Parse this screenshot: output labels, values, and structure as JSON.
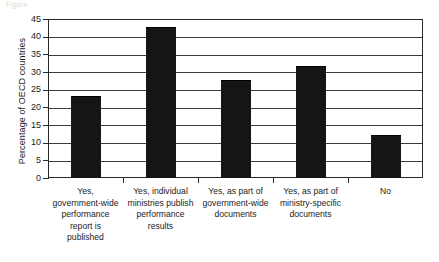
{
  "caption": {
    "text": "Figure"
  },
  "chart_data": {
    "type": "bar",
    "title": "",
    "xlabel": "",
    "ylabel": "Percentage of OECD countries",
    "categories": [
      "Yes, government-wide performance report is published",
      "Yes, individual ministries publish performance results",
      "Yes, as part of government-wide documents",
      "Yes, as part of ministry-specific documents",
      "No"
    ],
    "category_lines": [
      [
        "Yes,",
        "government-wide",
        "performance",
        "report is",
        "published"
      ],
      [
        "Yes, individual",
        "ministries publish",
        "performance",
        "results"
      ],
      [
        "Yes, as part of",
        "government-wide",
        "documents"
      ],
      [
        "Yes, as part of",
        "ministry-specific",
        "documents"
      ],
      [
        "No"
      ]
    ],
    "values": [
      23,
      42.5,
      27.5,
      31.5,
      12
    ],
    "ylim": [
      0,
      45
    ],
    "ytick_step": 5,
    "yticks": [
      0,
      5,
      10,
      15,
      20,
      25,
      30,
      35,
      40,
      45
    ],
    "ytick_labels": [
      "0",
      "5",
      "10",
      "15",
      "20",
      "25",
      "30",
      "35",
      "40",
      "45"
    ],
    "grid": true,
    "legend": "none",
    "bar_color": "#151515",
    "axis_color": "#2a2a2a",
    "grid_color": "#3a3a3a",
    "background": "#ffffff"
  }
}
